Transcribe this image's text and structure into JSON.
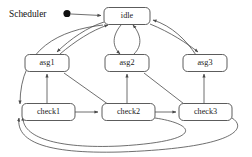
{
  "diagram": {
    "caption": "Scheduler",
    "type": "state-machine",
    "initial_marker": "filled-dot",
    "nodes": [
      {
        "id": "idle",
        "label": "idle",
        "x": 127,
        "y": 16,
        "w": 46,
        "h": 17
      },
      {
        "id": "asg1",
        "label": "asg1",
        "x": 47,
        "y": 63,
        "w": 44,
        "h": 17
      },
      {
        "id": "asg2",
        "label": "asg2",
        "x": 127,
        "y": 63,
        "w": 44,
        "h": 17
      },
      {
        "id": "asg3",
        "label": "asg3",
        "x": 205,
        "y": 63,
        "w": 44,
        "h": 17
      },
      {
        "id": "check1",
        "label": "check1",
        "x": 48,
        "y": 112,
        "w": 52,
        "h": 17
      },
      {
        "id": "check2",
        "label": "check2",
        "x": 128,
        "y": 112,
        "w": 52,
        "h": 17
      },
      {
        "id": "check3",
        "label": "check3",
        "x": 205,
        "y": 112,
        "w": 52,
        "h": 17
      }
    ],
    "edges": [
      {
        "from": "start",
        "to": "idle"
      },
      {
        "from": "idle",
        "to": "asg1"
      },
      {
        "from": "idle",
        "to": "asg2"
      },
      {
        "from": "idle",
        "to": "asg3"
      },
      {
        "from": "idle",
        "to": "check1"
      },
      {
        "from": "asg1",
        "to": "idle"
      },
      {
        "from": "asg2",
        "to": "idle"
      },
      {
        "from": "asg3",
        "to": "idle"
      },
      {
        "from": "check1",
        "to": "asg1"
      },
      {
        "from": "check2",
        "to": "asg2"
      },
      {
        "from": "check3",
        "to": "asg3"
      },
      {
        "from": "asg1",
        "to": "check2"
      },
      {
        "from": "asg2",
        "to": "check3"
      },
      {
        "from": "check1",
        "to": "check2"
      },
      {
        "from": "check2",
        "to": "check3"
      },
      {
        "from": "check2",
        "to": "check1"
      },
      {
        "from": "check3",
        "to": "check1"
      }
    ],
    "colors": {
      "stroke": "#4a4a4a",
      "text": "#1a1a1a",
      "background": "#ffffff",
      "dot": "#111111"
    }
  }
}
